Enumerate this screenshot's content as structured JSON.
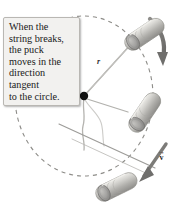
{
  "figure": {
    "background_color": "#ffffff"
  },
  "callout": {
    "name": "explanation-callout",
    "background_color": "#f2f1ef",
    "border_color": "#b9b7b3",
    "text": "When the string breaks, the puck moves in the direction tangent to the circle.",
    "lines": [
      "When the",
      "string breaks,",
      "the puck",
      "moves in the",
      "direction",
      "tangent",
      "to the circle."
    ]
  },
  "labels": {
    "radius": "r",
    "velocity": "v",
    "velocity_arrow": "→"
  },
  "colors": {
    "puck_body": "#bdbcb8",
    "puck_face": "#9a9a98",
    "puck_highlight": "#e3e2de",
    "string": "#a9a8a4",
    "dashed_circle": "#8d8c88",
    "arrow": "#7c7b78",
    "center_dot": "#111111",
    "text": "#1a1a1a"
  },
  "elements": {
    "center_pivot": "center-pivot-dot",
    "dashed_circle": "circular-path-dashed",
    "motion_arrow": "motion-direction-arrow",
    "velocity_arrow": "velocity-vector-arrow",
    "radius_line": "radius-string-line",
    "tangent_line": "tangent-path-line",
    "puck_top": "puck-position-top",
    "puck_right": "puck-position-right",
    "puck_bottom": "puck-position-bottom"
  }
}
